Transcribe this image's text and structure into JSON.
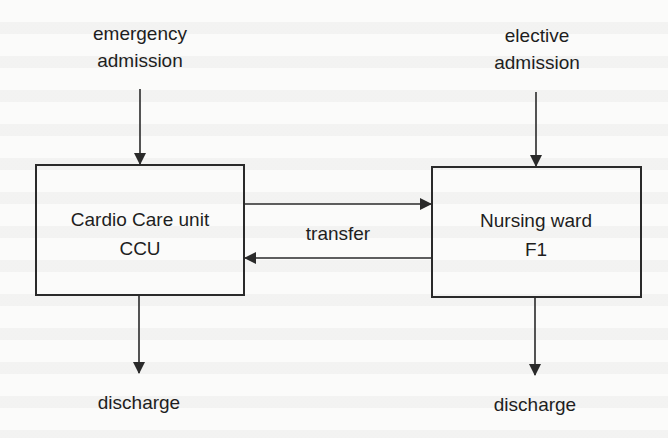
{
  "diagram": {
    "type": "patient-flow",
    "colors": {
      "stroke": "#2a2a2a",
      "text": "#1e1e1e",
      "background": "#fbfbfa"
    },
    "nodes": {
      "ccu": {
        "line1": "Cardio Care unit",
        "line2": "CCU"
      },
      "f1": {
        "line1": "Nursing ward",
        "line2": "F1"
      }
    },
    "inputs": {
      "emergency": {
        "line1": "emergency",
        "line2": "admission"
      },
      "elective": {
        "line1": "elective",
        "line2": "admission"
      }
    },
    "outputs": {
      "ccu_discharge": "discharge",
      "f1_discharge": "discharge"
    },
    "edges": {
      "transfer_label": "transfer"
    }
  }
}
